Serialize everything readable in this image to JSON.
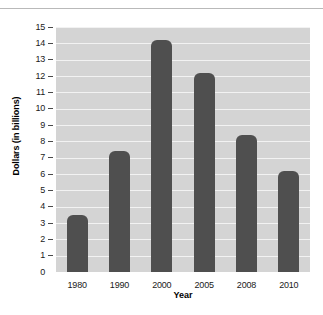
{
  "chart_data": {
    "type": "bar",
    "title": "",
    "xlabel": "Year",
    "ylabel": "Dollars (in billions)",
    "categories": [
      "1980",
      "1990",
      "2000",
      "2005",
      "2008",
      "2010"
    ],
    "values": [
      3.5,
      7.4,
      14.2,
      12.2,
      8.4,
      6.2
    ],
    "ylim": [
      0,
      15
    ],
    "ytick_step": 1,
    "yticks": [
      15,
      14,
      13,
      12,
      11,
      10,
      9,
      8,
      7,
      6,
      5,
      4,
      3,
      2,
      1,
      0
    ],
    "grid": true,
    "legend": "none",
    "colors": {
      "bar": "#4f4f4f",
      "plot_background": "#d4d4d4",
      "gridline": "#f2f2f2",
      "page_background": "#ffffff",
      "text": "#1a1a1a"
    }
  }
}
